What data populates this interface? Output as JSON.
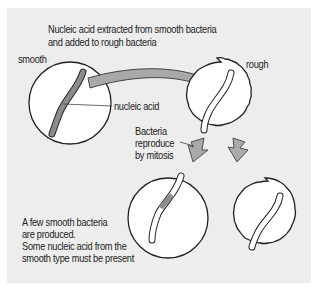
{
  "diagram": {
    "title_line1": "Nucleic acid extracted from smooth bacteria",
    "title_line2": "and added to rough bacteria",
    "labels": {
      "smooth": "smooth",
      "rough": "rough",
      "nucleic_acid": "nucleic acid",
      "reproduce_line1": "Bacteria",
      "reproduce_line2": "reproduce",
      "reproduce_line3": "by mitosis"
    },
    "conclusion": {
      "line1": "A few smooth bacteria",
      "line2": "are produced.",
      "line3": "Some nucleic acid from the",
      "line4": "smooth type must be present"
    },
    "colors": {
      "panel": "#ededed",
      "arrow_fill": "#a9a9a9",
      "nucleic_acid_fill": "#8c8c8c",
      "cell_fill": "#ffffff",
      "outline": "#222222"
    }
  }
}
